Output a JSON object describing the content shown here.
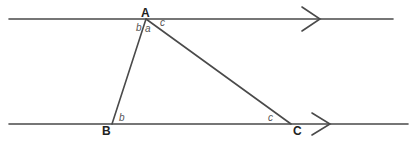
{
  "diagram": {
    "colors": {
      "stroke": "#4a4a4a",
      "text": "#222222",
      "angle_text": "#555555"
    },
    "parallel_lines": [
      {
        "id": "top",
        "y": 19,
        "x1": 9,
        "x2": 393,
        "arrow_x": 320
      },
      {
        "id": "bottom",
        "y": 124,
        "x1": 9,
        "x2": 408,
        "arrow_x": 330
      }
    ],
    "vertices": {
      "A": {
        "label": "A",
        "x": 146,
        "y": 19
      },
      "B": {
        "label": "B",
        "x": 112,
        "y": 124
      },
      "C": {
        "label": "C",
        "x": 291,
        "y": 124
      }
    },
    "angle_labels": {
      "A_left": "b",
      "A_mid": "a",
      "A_right": "c",
      "B": "b",
      "C": "c"
    }
  }
}
